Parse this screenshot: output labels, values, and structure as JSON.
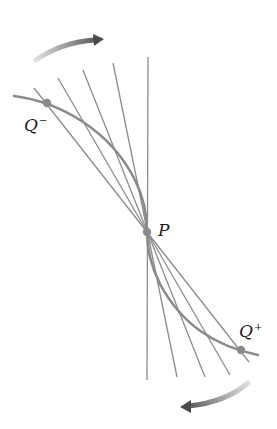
{
  "figure": {
    "colors": {
      "background": "#ffffff",
      "line": "#8c8c8c",
      "curve": "#8a8a8a",
      "point": "#8a8a8a",
      "arrow_dark": "#555555",
      "arrow_light": "#d8d8d8",
      "label": "#1a1a1a"
    },
    "points": {
      "q_minus": {
        "label": "Q",
        "superscript": "−",
        "x": 47,
        "y": 103
      },
      "p": {
        "label": "P",
        "superscript": "",
        "x": 147,
        "y": 232
      },
      "q_plus": {
        "label": "Q",
        "superscript": "+",
        "x": 241,
        "y": 350
      }
    },
    "lines": [
      {
        "name": "tangent-vertical",
        "x1": 148,
        "y1": 57,
        "x2": 147,
        "y2": 380
      },
      {
        "name": "secant-1",
        "x1": 113,
        "y1": 63,
        "x2": 177,
        "y2": 377
      },
      {
        "name": "secant-2",
        "x1": 83,
        "y1": 70,
        "x2": 205,
        "y2": 377
      },
      {
        "name": "secant-3",
        "x1": 58,
        "y1": 78,
        "x2": 230,
        "y2": 375
      },
      {
        "name": "secant-4",
        "x1": 34,
        "y1": 88,
        "x2": 249,
        "y2": 362
      }
    ],
    "arrows": {
      "top": {
        "direction": "clockwise",
        "from": [
          36,
          60
        ],
        "to": [
          103,
          38
        ]
      },
      "bottom": {
        "direction": "clockwise",
        "from": [
          248,
          383
        ],
        "to": [
          181,
          408
        ]
      }
    }
  },
  "labels": {
    "q_minus": "Q",
    "q_minus_sup": "−",
    "p": "P",
    "q_plus": "Q",
    "q_plus_sup": "+"
  }
}
